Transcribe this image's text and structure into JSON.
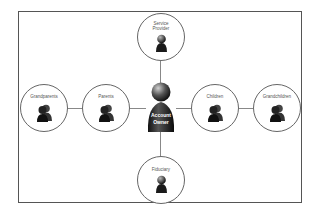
{
  "diagram": {
    "center": {
      "label_line1": "Account",
      "label_line2": "Owner"
    },
    "nodes": {
      "top": {
        "label_line1": "Service",
        "label_line2": "Provider",
        "icon": "single-person-icon"
      },
      "bottom": {
        "label": "Fiduciary",
        "icon": "single-person-icon"
      },
      "left_inner": {
        "label": "Parents",
        "icon": "group-person-icon"
      },
      "left_outer": {
        "label": "Grandparents",
        "icon": "group-person-icon"
      },
      "right_inner": {
        "label": "Children",
        "icon": "group-person-icon"
      },
      "right_outer": {
        "label": "Grandchildren",
        "icon": "group-person-icon"
      }
    },
    "colors": {
      "frame": "#555555",
      "line": "#888888",
      "circle": "#666666",
      "pawn": "#1a1a1a"
    }
  }
}
